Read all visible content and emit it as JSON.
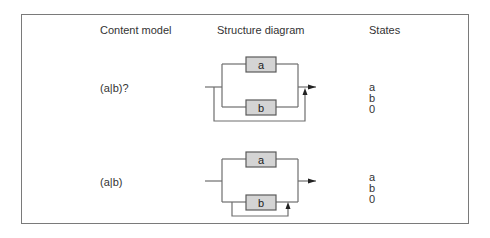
{
  "headers": {
    "content_model": "Content model",
    "structure_diagram": "Structure diagram",
    "states": "States"
  },
  "rows": [
    {
      "content_model": "(a|b)?",
      "diagram": {
        "top_box": "a",
        "bottom_box": "b",
        "loop": "bypass"
      },
      "states": [
        "a",
        "b",
        "0"
      ]
    },
    {
      "content_model": "(a|b)",
      "diagram": {
        "top_box": "a",
        "bottom_box": "b",
        "loop": "b-return"
      },
      "states": [
        "a",
        "b",
        "0"
      ]
    }
  ],
  "colors": {
    "box_fill": "#d4d4d4",
    "line": "#6e6e6e",
    "frame": "#7a7a7a"
  }
}
